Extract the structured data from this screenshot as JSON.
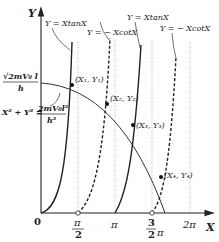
{
  "diagram": {
    "axes": {
      "y_label": "Y",
      "x_label": "X",
      "origin_label": "0"
    },
    "x_ticks": [
      {
        "num": "π",
        "den": "2",
        "label": "π/2"
      },
      {
        "label": "π"
      },
      {
        "num": "3",
        "den": "2",
        "suffix": "π",
        "label": "3/2 π"
      },
      {
        "label": "2π"
      }
    ],
    "y_tick": {
      "num": "√2mV₀ l",
      "den": "h"
    },
    "curve_labels": [
      "Y = XtanX",
      "Y = − XcotX",
      "Y = XtanX",
      "Y = − XcotX"
    ],
    "circle_equation": {
      "lhs": "X² + Y² =",
      "num": "2mV₀l²",
      "den": "h²"
    },
    "points": [
      "(X₁, Y₁)",
      "(X₂, Y₂)",
      "(X₃, Y₃)",
      "(X₄, Y₄)"
    ],
    "colors": {
      "line": "#222222",
      "guide": "#999999"
    }
  }
}
